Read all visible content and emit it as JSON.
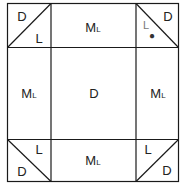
{
  "diagram": {
    "cells": {
      "top_left": {
        "upper": "D",
        "lower": "L"
      },
      "top_center": {
        "main": "M",
        "sub": "L"
      },
      "top_right": {
        "upper": "D",
        "lower": "L",
        "marker": "●"
      },
      "middle_left": {
        "main": "M",
        "sub": "L"
      },
      "center": {
        "main": "D"
      },
      "middle_right": {
        "main": "M",
        "sub": "L"
      },
      "bottom_left": {
        "upper": "L",
        "lower": "D"
      },
      "bottom_center": {
        "main": "M",
        "sub": "L"
      },
      "bottom_right": {
        "upper": "L",
        "lower": "D"
      }
    },
    "colors": {
      "line": "#1a1a1a",
      "text": "#222222"
    }
  }
}
